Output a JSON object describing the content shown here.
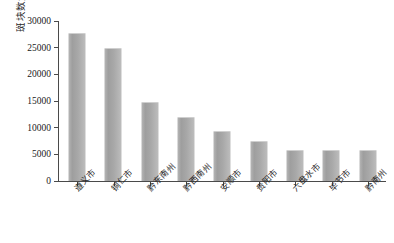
{
  "chart_data": {
    "type": "bar",
    "title": "",
    "subtitle": "",
    "xlabel": "",
    "ylabel": "斑块数量变化/个",
    "ylim": [
      0,
      30000
    ],
    "ytick_values": [
      0,
      5000,
      10000,
      15000,
      20000,
      25000,
      30000
    ],
    "ytick_labels": [
      "0",
      "5000",
      "10000",
      "15000",
      "20000",
      "25000",
      "30000"
    ],
    "grid": false,
    "legend": null,
    "legend_position": "none",
    "categories": [
      "遵义市",
      "铜仁市",
      "黔东南州",
      "黔西南州",
      "安顺市",
      "贵阳市",
      "六盘水市",
      "毕节市",
      "黔南州"
    ],
    "values": [
      27600,
      24700,
      14700,
      11800,
      9100,
      7400,
      5700,
      5600,
      5600
    ],
    "series": [
      {
        "name": "斑块数量变化",
        "values": [
          27600,
          24700,
          14700,
          11800,
          9100,
          7400,
          5700,
          5600,
          5600
        ]
      }
    ],
    "bar_color": "#a8a8a8",
    "axis_color": "#4a4a4a"
  }
}
